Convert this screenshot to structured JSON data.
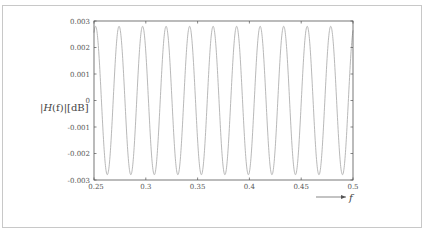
{
  "chart_data": {
    "type": "line",
    "title": "",
    "xlabel": "f",
    "ylabel": "|H(f)| [dB]",
    "xlim": [
      0.25,
      0.5
    ],
    "ylim": [
      -0.003,
      0.003
    ],
    "x_ticks": [
      "0.25",
      "0.3",
      "0.35",
      "0.4",
      "0.45",
      "0.5"
    ],
    "y_ticks": [
      "0.003",
      "0.002",
      "0.001",
      "0",
      "-0.001",
      "-0.002",
      "-0.003"
    ],
    "grid": false,
    "legend": null,
    "series": [
      {
        "name": "|H(f)|",
        "description": "sinusoidal ripple, amplitude ≈ 0.0028 dB, period ≈ 0.0227 in f (~11 cycles over 0.25–0.5)",
        "amplitude": 0.0028,
        "period": 0.0227,
        "peak_x": [
          0.2515,
          0.274,
          0.297,
          0.32,
          0.342,
          0.365,
          0.388,
          0.41,
          0.433,
          0.456,
          0.479
        ],
        "trough_x": [
          0.2565,
          0.2855,
          0.3085,
          0.331,
          0.354,
          0.376,
          0.399,
          0.422,
          0.444,
          0.467,
          0.49
        ],
        "color": "#b0b0b0"
      }
    ]
  },
  "labels": {
    "ylabel_prefix": "|",
    "ylabel_func": "H",
    "ylabel_arg": "(f)",
    "ylabel_suffix": "|[dB]",
    "xlabel": "f"
  },
  "colors": {
    "frame": "#c8c8c8",
    "axes": "#555555",
    "curve": "#b0b0b0",
    "text": "#555555"
  }
}
